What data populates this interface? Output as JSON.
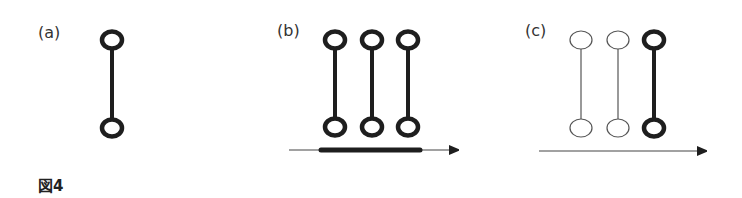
{
  "figure": {
    "caption": "図4",
    "colors": {
      "stroke": "#1e1e1e",
      "thin_stroke": "#555555",
      "background": "#ffffff"
    },
    "panels": [
      {
        "label": "(a)",
        "molecules": [
          {
            "style": "thick"
          }
        ],
        "arrow": null
      },
      {
        "label": "(b)",
        "molecules": [
          {
            "style": "thick"
          },
          {
            "style": "thick"
          },
          {
            "style": "thick"
          }
        ],
        "arrow": {
          "style": "thin",
          "highlight_bar": true
        }
      },
      {
        "label": "(c)",
        "molecules": [
          {
            "style": "thin"
          },
          {
            "style": "thin"
          },
          {
            "style": "thick"
          }
        ],
        "arrow": {
          "style": "thin",
          "highlight_bar": false
        }
      }
    ]
  }
}
